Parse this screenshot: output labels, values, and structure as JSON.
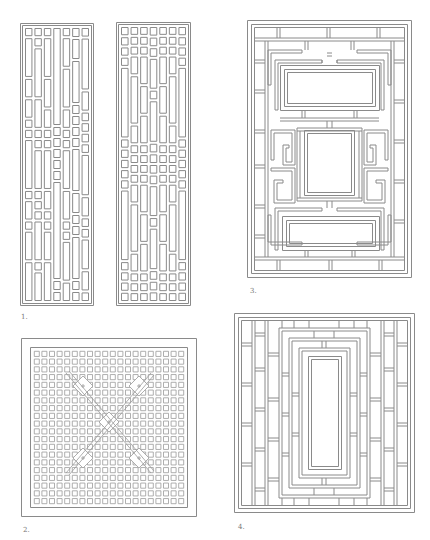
{
  "page": {
    "background": "#ffffff",
    "line_color": "#8a8a8a"
  },
  "figures": [
    {
      "id": "fig-1",
      "label": "1.",
      "description": "Pair of tall narrow lattice panels with staggered vertical rectangles and square cells"
    },
    {
      "id": "fig-2",
      "label": "2.",
      "description": "Square lattice grid of small squares with five diagonal star motifs"
    },
    {
      "id": "fig-3",
      "label": "3.",
      "description": "Rectangular fretwork lattice with three open rectangular cartouches"
    },
    {
      "id": "fig-4",
      "label": "4.",
      "description": "Rectangular fretwork lattice with single tall central opening"
    }
  ]
}
